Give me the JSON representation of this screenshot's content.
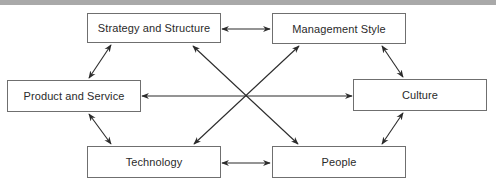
{
  "diagram": {
    "type": "relationship-network",
    "header_bar": "",
    "nodes": [
      {
        "id": "strategy",
        "label": "Strategy and Structure"
      },
      {
        "id": "management",
        "label": "Management Style"
      },
      {
        "id": "product",
        "label": "Product and Service"
      },
      {
        "id": "culture",
        "label": "Culture"
      },
      {
        "id": "technology",
        "label": "Technology"
      },
      {
        "id": "people",
        "label": "People"
      }
    ],
    "edges": [
      {
        "from": "strategy",
        "to": "management",
        "bidirectional": true
      },
      {
        "from": "strategy",
        "to": "product",
        "bidirectional": true
      },
      {
        "from": "management",
        "to": "culture",
        "bidirectional": true
      },
      {
        "from": "product",
        "to": "technology",
        "bidirectional": true
      },
      {
        "from": "culture",
        "to": "people",
        "bidirectional": true
      },
      {
        "from": "technology",
        "to": "people",
        "bidirectional": true
      },
      {
        "from": "product",
        "to": "culture",
        "bidirectional": true
      },
      {
        "from": "strategy",
        "to": "people",
        "bidirectional": true
      },
      {
        "from": "management",
        "to": "technology",
        "bidirectional": true
      }
    ],
    "colors": {
      "border": "#6f6f6f",
      "arrow": "#2b2b2b",
      "header_bar": "#a9a9a9"
    }
  }
}
